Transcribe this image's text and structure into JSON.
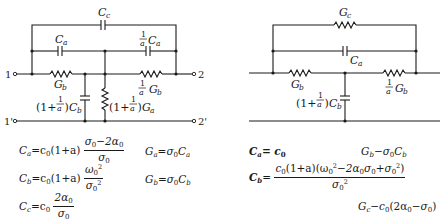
{
  "figures": {
    "left": {
      "terminals": {
        "in_top": "1",
        "out_top": "2",
        "in_bot": "1'",
        "out_bot": "2'"
      },
      "components": {
        "top_cap": "C_c",
        "mid_left_cap": "C_a",
        "mid_right_cap": "(1/a) C_a",
        "series_left_res": "G_b",
        "series_right_res": "(1/a) G_b",
        "shunt_cap": "(1 + 1/a) C_b",
        "shunt_res": "(1 + 1/a) G_a"
      },
      "equations": [
        {
          "lhs": "C_a",
          "rhs": "c0(1+a) (σ0 − 2α0)/σ0"
        },
        {
          "lhs": "C_b",
          "rhs": "c0(1+a) ω0²/σ0²"
        },
        {
          "lhs": "C_c",
          "rhs": "c0 2α0/σ0"
        },
        {
          "lhs": "G_a",
          "rhs": "σ0 C_a"
        },
        {
          "lhs": "G_b",
          "rhs": "σ0 C_b"
        }
      ]
    },
    "right": {
      "components": {
        "top_res": "G_c",
        "mid_cap": "C_a",
        "series_left_res": "G_b",
        "series_right_res": "(1/a) G_b",
        "shunt_cap": "(1 + 1/a) C_b"
      },
      "equations": [
        {
          "lhs": "C_a",
          "rhs": "c0"
        },
        {
          "lhs": "C_b",
          "rhs": "c0(1+a)(ω0² − 2α0σ0 + σ0²)/σ0²"
        },
        {
          "lhs": "G_b",
          "rhs": "σ0 C_b"
        },
        {
          "lhs": "G_c",
          "rhs": "c0(2α0 − σ0)"
        }
      ]
    }
  },
  "text": {
    "t1": "1",
    "t2": "2",
    "t1p": "1'",
    "t2p": "2'",
    "C": "C",
    "G": "G",
    "a": "a",
    "c": "c",
    "b": "b",
    "one": "1",
    "one_plus": "(1+",
    "close_paren": ")",
    "eq_l1_lhs": "C",
    "eq_l1_sub": "a",
    "eq_l1_mid": "=c",
    "eq_l1_mid2": "(1+a)",
    "eq_l1_num": "σ",
    "eq_l1_num2": "−2α",
    "eq_l1_den": "σ",
    "eq_l2_lhs": "C",
    "eq_l2_sub": "b",
    "eq_l2_num": "ω",
    "eq_l2_den": "σ",
    "eq_l3_lhs": "C",
    "eq_l3_sub": "c",
    "eq_l3_mid": "=c",
    "eq_l3_num": "2α",
    "eq_l3_den": "σ",
    "eq_l4_lhs": "G",
    "eq_l4_sub": "a",
    "eq_l4_rhs": "=σ",
    "eq_l4_rhs2": "C",
    "eq_l5_lhs": "G",
    "eq_l5_sub": "b",
    "eq_l5_rhs": "=σ",
    "eq_l5_rhs2": "C",
    "eq_r1_lhs": "C",
    "eq_r1_sub": "a",
    "eq_r1_rhs": "= c",
    "eq_r2_lhs": "G",
    "eq_r2_sub": "b",
    "eq_r2_rhs": "−σ",
    "eq_r2_rhs2": "C",
    "eq_r3_lhs": "C",
    "eq_r3_sub": "b",
    "eq_r3_eq": "=",
    "eq_r3_num_a": "c",
    "eq_r3_num_b": "(1+a)(ω",
    "eq_r3_num_c": "−2α",
    "eq_r3_num_d": "σ",
    "eq_r3_num_e": "+σ",
    "eq_r3_num_f": ")",
    "eq_r3_den": "σ",
    "eq_r4_lhs": "G",
    "eq_r4_sub": "c",
    "eq_r4_rhs": "−c",
    "eq_r4_rhs2": "(2α",
    "eq_r4_rhs3": "−σ",
    "eq_r4_rhs4": ")",
    "zero": "0",
    "two": "2",
    "eq_l2_mid": "=c"
  }
}
